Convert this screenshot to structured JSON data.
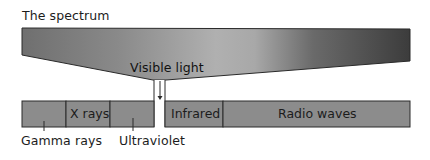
{
  "title": "The spectrum",
  "funnel": {
    "label": "Visible light",
    "gradient": {
      "left_color": "#6f6f6f",
      "mid_light_color": "#b4b4b4",
      "right_color": "#3e3e3e"
    }
  },
  "bands": [
    {
      "id": "gamma",
      "label": "Gamma rays",
      "label_position": "below",
      "color": "#8c8c8c"
    },
    {
      "id": "xray",
      "label": "X rays",
      "label_position": "inside",
      "color": "#8c8c8c"
    },
    {
      "id": "ultraviolet",
      "label": "Ultraviolet",
      "label_position": "below",
      "color": "#8c8c8c"
    },
    {
      "id": "visible",
      "label": "",
      "label_position": "none",
      "color": "#ffffff"
    },
    {
      "id": "infrared",
      "label": "Infrared",
      "label_position": "inside",
      "color": "#8c8c8c"
    },
    {
      "id": "radio",
      "label": "Radio waves",
      "label_position": "inside",
      "color": "#8c8c8c"
    }
  ],
  "colors": {
    "band_fill": "#8c8c8c",
    "outline": "#2a2a2a",
    "background": "#ffffff"
  }
}
